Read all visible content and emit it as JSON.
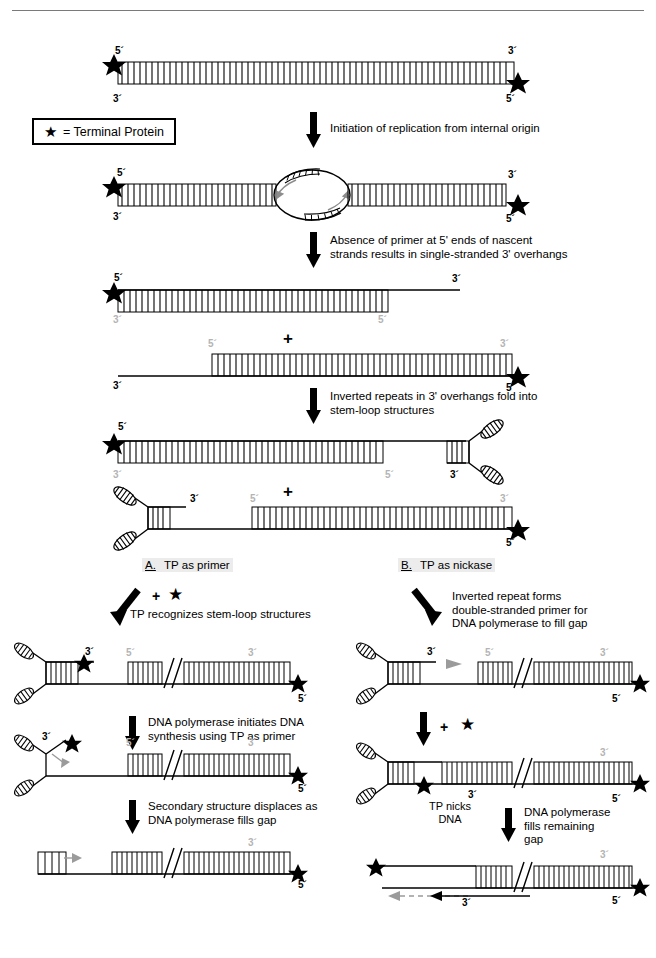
{
  "header": {
    "running_head": ""
  },
  "legend": {
    "symbol": "★",
    "text": "= Terminal Protein"
  },
  "steps": [
    {
      "id": "s1",
      "caption": "Initiation of replication from internal origin"
    },
    {
      "id": "s2",
      "caption": "Absence of primer at 5' ends of nascent\nstrands results in single-stranded 3' overhangs"
    },
    {
      "id": "s3",
      "caption": "Inverted repeats in 3' overhangs fold into\nstem-loop structures"
    }
  ],
  "branches": {
    "a": {
      "heading_letter": "A.",
      "heading_text": "TP as primer",
      "step1_plus": "+",
      "step1_star": "★",
      "step1_caption": "TP recognizes stem-loop structures",
      "step2_caption": "DNA polymerase initiates DNA\nsynthesis using TP as primer",
      "step3_caption": "Secondary structure displaces as\nDNA polymerase fills gap"
    },
    "b": {
      "heading_letter": "B.",
      "heading_text": "TP as nickase",
      "step1_caption": "Inverted repeat forms\ndouble-stranded primer for\nDNA polymerase to fill gap",
      "step2_plus": "+",
      "step2_star": "★",
      "step2_note": "TP nicks\nDNA",
      "step3_caption": "DNA polymerase\nfills remaining\ngap"
    }
  },
  "labels": {
    "five_prime": "5´",
    "three_prime": "3´",
    "plus": "+"
  },
  "panels": {
    "p1": {
      "left_top": "5´",
      "left_bottom": "3´",
      "right_top": "3´",
      "right_bottom": "5´"
    },
    "p2": {
      "left_top": "5´",
      "left_bottom": "3´",
      "right_top": "3´",
      "right_bottom": "5´"
    },
    "p3a": {
      "left_top": "5´",
      "left_bottom": "3´",
      "right_top": "3´",
      "mid_bottom": "5´"
    },
    "p3b": {
      "left_top": "5´",
      "left_bottom": "3´",
      "right_top": "3´",
      "right_bottom": "5´"
    },
    "p4a": {
      "left_top": "5´",
      "left_bottom": "3´",
      "mid_bottom": "5´",
      "loop_bottom": "3´",
      "right_top": "3´"
    },
    "p4b": {
      "loop_top": "3´",
      "mid_top": "5´",
      "right_top": "3´",
      "right_bottom": "5´",
      "left_bottom": "3´"
    },
    "a1": {
      "loop_label": "3´",
      "mid_top": "5´",
      "right_top": "3´",
      "right_bottom": "5´"
    },
    "a2": {
      "loop_label": "3´",
      "mid_top": "5´",
      "right_top": "3´",
      "right_bottom": "5´"
    },
    "a3": {
      "right_top": "3´",
      "right_bottom": "5´"
    },
    "b1": {
      "loop_label": "3´",
      "mid_top": "5´",
      "right_top": "3´",
      "right_bottom": "5´"
    },
    "b2": {
      "nick_label": "3´",
      "right_top": "3´",
      "right_bottom": "5´"
    },
    "b3": {
      "arrow_label": "3´",
      "right_top": "3´",
      "right_bottom": "5´"
    }
  },
  "colors": {
    "ink": "#000000",
    "gray_label": "#b4b4b4",
    "rule": "#7a7a7a",
    "section_bg": "#ececec"
  }
}
